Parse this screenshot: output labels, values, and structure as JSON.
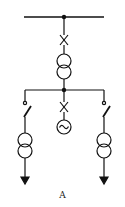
{
  "diagram": {
    "type": "single-line electrical schematic",
    "caption": "A",
    "stroke_color": "#111111",
    "elements": [
      {
        "id": "main-busbar",
        "kind": "busbar"
      },
      {
        "id": "incoming-breaker",
        "kind": "circuit-breaker"
      },
      {
        "id": "main-transformer",
        "kind": "two-winding-transformer"
      },
      {
        "id": "secondary-busbar",
        "kind": "busbar"
      },
      {
        "id": "left-feeder",
        "kind": "feeder",
        "components": [
          "terminal",
          "disconnector",
          "two-winding-transformer",
          "load-arrow"
        ]
      },
      {
        "id": "center-feeder",
        "kind": "feeder",
        "components": [
          "circuit-breaker",
          "generator"
        ]
      },
      {
        "id": "right-feeder",
        "kind": "feeder",
        "components": [
          "terminal",
          "disconnector",
          "two-winding-transformer",
          "load-arrow"
        ]
      }
    ],
    "generator_symbol": "~"
  }
}
